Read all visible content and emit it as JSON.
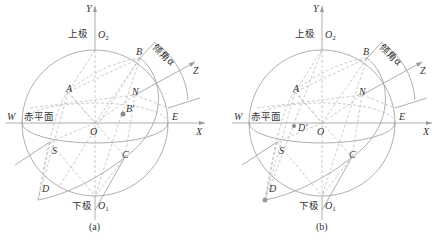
{
  "colors": {
    "line": "#9a9a9a",
    "dashed": "#b5b5b5",
    "text": "#333333",
    "point": "#8a8a8a"
  },
  "panels": [
    {
      "caption": "(a)",
      "labels": {
        "Y": "Y",
        "X": "X",
        "Z": "Z",
        "O": "O",
        "O2": "O",
        "O2_sub": "2",
        "O1": "O",
        "O1_sub": "1",
        "upper_pole": "上极",
        "lower_pole": "下极",
        "equatorial_plane": "赤平面",
        "dip_angle": "倾角α",
        "A": "A",
        "B": "B",
        "C": "C",
        "D": "D",
        "E": "E",
        "N": "N",
        "S": "S",
        "W": "W",
        "projection": "B′"
      }
    },
    {
      "caption": "(b)",
      "labels": {
        "Y": "Y",
        "X": "X",
        "Z": "Z",
        "O": "O",
        "O2": "O",
        "O2_sub": "2",
        "O1": "O",
        "O1_sub": "1",
        "upper_pole": "上极",
        "lower_pole": "下极",
        "equatorial_plane": "赤平面",
        "dip_angle": "倾角α",
        "A": "A",
        "B": "B",
        "C": "C",
        "D": "D",
        "E": "E",
        "N": "N",
        "S": "S",
        "W": "W",
        "projection": "D′"
      }
    }
  ]
}
